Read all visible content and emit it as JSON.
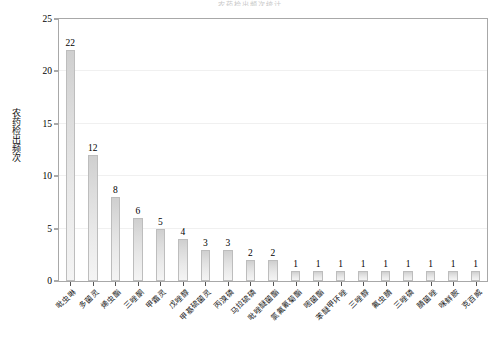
{
  "chart_data": {
    "type": "bar",
    "title": "农药检出频次统计",
    "xlabel": "",
    "ylabel": "农药检出频次",
    "ylim": [
      0,
      25
    ],
    "yticks": [
      0,
      5,
      10,
      15,
      20,
      25
    ],
    "grid": "horizontal-major-faint",
    "legend": "none",
    "orientation": "vertical",
    "bar_color": "#dcdcdc",
    "bar_edge_color": "#bdbdbd",
    "categories": [
      "吡虫啉",
      "多菌灵",
      "烯虫酯",
      "三唑酮",
      "甲霜灵",
      "戊唑醇",
      "甲基硫菌灵",
      "丙溴磷",
      "马拉硫磷",
      "吡唑醚菌酯",
      "氯氟氰菊酯",
      "嘧菌酯",
      "苯醚甲环唑",
      "三唑醇",
      "氟虫腈",
      "三唑磷",
      "腈菌唑",
      "咪鲜胺",
      "克百威"
    ],
    "values": [
      22,
      12,
      8,
      6,
      5,
      4,
      3,
      3,
      2,
      2,
      1,
      1,
      1,
      1,
      1,
      1,
      1,
      1,
      1
    ],
    "value_labels": [
      "22",
      "12",
      "8",
      "6",
      "5",
      "4",
      "3",
      "3",
      "2",
      "2",
      "1",
      "1",
      "1",
      "1",
      "1",
      "1",
      "1",
      "1",
      "1"
    ]
  }
}
